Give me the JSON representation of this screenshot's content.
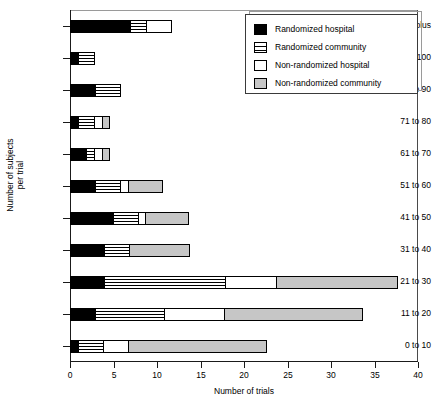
{
  "chart_data": {
    "type": "bar",
    "orientation": "horizontal",
    "stacked": true,
    "title": "",
    "xlabel": "Number of trials",
    "ylabel": "Number of subjects\nper trial",
    "xlim": [
      0,
      40
    ],
    "xticks": [
      0,
      5,
      10,
      15,
      20,
      25,
      30,
      35,
      40
    ],
    "xticklabels": [
      "0",
      "5",
      "10",
      "15",
      "20",
      "25",
      "30",
      "35",
      "40"
    ],
    "grid": false,
    "legend_position": "top-right",
    "categories": [
      "101 plus",
      "91 to 100",
      "81 to 90",
      "71 to 80",
      "61 to 70",
      "51 to 60",
      "41 to 50",
      "31 to 40",
      "21 to 30",
      "11 to 20",
      "0 to 10"
    ],
    "series": [
      {
        "name": "Randomized hospital",
        "color": "#000000",
        "pattern": "solid-black",
        "values": [
          7,
          1,
          3,
          1,
          2,
          3,
          5,
          4,
          4,
          3,
          1
        ]
      },
      {
        "name": "Randomized community",
        "color": "#ffffff",
        "pattern": "horizontal-stripes",
        "values": [
          2,
          2,
          3,
          2,
          1,
          3,
          3,
          3,
          14,
          8,
          3
        ]
      },
      {
        "name": "Non-randomized hospital",
        "color": "#ffffff",
        "pattern": "solid-white",
        "values": [
          3,
          0,
          0,
          1,
          1,
          1,
          1,
          0,
          6,
          7,
          3
        ]
      },
      {
        "name": "Non-randomized community",
        "color": "#c6c6c6",
        "pattern": "solid-gray",
        "values": [
          0,
          0,
          0,
          1,
          1,
          4,
          5,
          7,
          14,
          16,
          16
        ]
      }
    ],
    "totals": [
      12,
      3,
      6,
      5,
      5,
      11,
      14,
      14,
      38,
      34,
      23
    ]
  },
  "legend": {
    "entries": [
      {
        "label": "Randomized hospital",
        "swatch": "rand-hosp"
      },
      {
        "label": "Randomized community",
        "swatch": "rand-comm"
      },
      {
        "label": "Non-randomized hospital",
        "swatch": "nonrand-hosp"
      },
      {
        "label": "Non-randomized community",
        "swatch": "nonrand-comm"
      }
    ]
  }
}
